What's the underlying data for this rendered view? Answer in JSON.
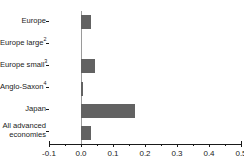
{
  "title_faint": "",
  "chart_data": {
    "type": "bar",
    "orientation": "horizontal",
    "title": "",
    "subtitle": "",
    "xlabel": "",
    "ylabel": "",
    "xlim": [
      -0.1,
      0.5
    ],
    "xticks": [
      -0.1,
      0.0,
      0.1,
      0.2,
      0.3,
      0.4,
      0.5
    ],
    "xticklabels": [
      "-0.1",
      "0.0",
      "0.1",
      "0.2",
      "0.3",
      "0.4",
      "0.5"
    ],
    "grid": false,
    "legend": null,
    "bar_color": "#626262",
    "axis_color": "#1a1a1a",
    "zero_line_color": "#9a9a9a",
    "categories": [
      "Europe",
      "Europe large",
      "Europe small",
      "Anglo-Saxon",
      "Japan",
      "All advanced economies"
    ],
    "category_labels": [
      {
        "text": "Europe",
        "footnote": ""
      },
      {
        "text": "Europe large",
        "footnote": "2"
      },
      {
        "text": "Europe small",
        "footnote": "3"
      },
      {
        "text": "Anglo-Saxon",
        "footnote": "4"
      },
      {
        "text": "Japan",
        "footnote": ""
      },
      {
        "text": "All advanced economies",
        "footnote": ""
      }
    ],
    "values": [
      0.03,
      0.0,
      0.045,
      0.005,
      0.17,
      0.03
    ],
    "series": [
      {
        "name": "value",
        "values": [
          0.03,
          0.0,
          0.045,
          0.005,
          0.17,
          0.03
        ]
      }
    ]
  }
}
